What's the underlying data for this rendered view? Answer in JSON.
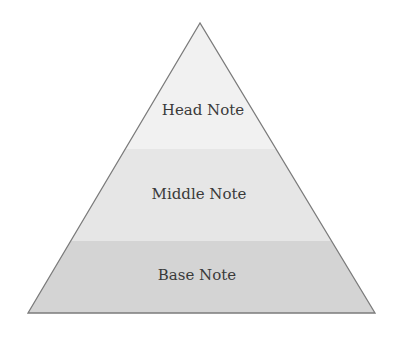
{
  "diagram": {
    "type": "pyramid",
    "layers": [
      {
        "label": "Head Note",
        "color": "#f1f1f1"
      },
      {
        "label": "Middle Note",
        "color": "#e6e6e6"
      },
      {
        "label": "Base Note",
        "color": "#d4d4d4"
      }
    ],
    "outline_color": "#7b7b7b",
    "text_color": "#3a3a3a"
  }
}
